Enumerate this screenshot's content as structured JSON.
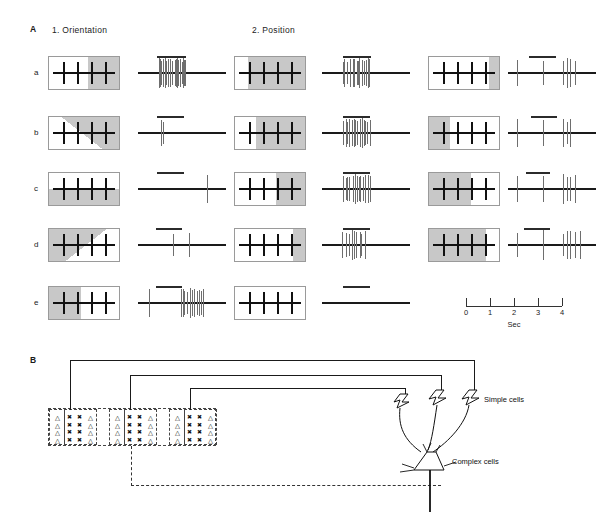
{
  "figure": {
    "panels": [
      {
        "letter": "A",
        "x": 30,
        "y": 24
      },
      {
        "letter": "B",
        "x": 30,
        "y": 355
      }
    ],
    "column_headers": [
      {
        "label": "1.   Orientation",
        "x": 52,
        "y": 26
      },
      {
        "label": "2.   Position",
        "x": 252,
        "y": 26
      }
    ],
    "row_letters": [
      "a",
      "b",
      "c",
      "d",
      "e"
    ]
  },
  "panel_a": {
    "rows": [
      {
        "letter": "a",
        "cells": [
          {
            "column": "orientation",
            "stimulus": {
              "shade_type": "vertical-right",
              "shade_fraction": 0.45,
              "bars": 4
            },
            "response": {
              "spike_count": 19,
              "pattern": "strong-burst",
              "stim_bar_start_pct": 22,
              "stim_bar_width_pct": 32
            }
          },
          {
            "column": "position",
            "stimulus": {
              "shade_type": "vertical-right",
              "shade_fraction": 0.82,
              "bars": 4
            },
            "response": {
              "spike_count": 15,
              "pattern": "strong-burst",
              "stim_bar_start_pct": 24,
              "stim_bar_width_pct": 32
            }
          },
          {
            "column": "position-2",
            "stimulus": {
              "shade_type": "vertical-right",
              "shade_fraction": 0.14,
              "bars": 4
            },
            "response": {
              "spike_count": 6,
              "pattern": "sparse",
              "stim_bar_start_pct": 24,
              "stim_bar_width_pct": 30
            }
          }
        ]
      },
      {
        "letter": "b",
        "cells": [
          {
            "column": "orientation",
            "stimulus": {
              "shade_type": "diagonal-ne",
              "shade_fraction": 0.5,
              "bars": 4
            },
            "response": {
              "spike_count": 2,
              "pattern": "single",
              "stim_bar_start_pct": 22,
              "stim_bar_width_pct": 30
            }
          },
          {
            "column": "position",
            "stimulus": {
              "shade_type": "vertical-right",
              "shade_fraction": 0.7,
              "bars": 4
            },
            "response": {
              "spike_count": 14,
              "pattern": "strong-burst",
              "stim_bar_start_pct": 24,
              "stim_bar_width_pct": 30
            }
          },
          {
            "column": "position-2",
            "stimulus": {
              "shade_type": "vertical-left",
              "shade_fraction": 0.3,
              "bars": 4
            },
            "response": {
              "spike_count": 5,
              "pattern": "sparse",
              "stim_bar_start_pct": 26,
              "stim_bar_width_pct": 30
            }
          }
        ]
      },
      {
        "letter": "c",
        "cells": [
          {
            "column": "orientation",
            "stimulus": {
              "shade_type": "horizontal-bottom",
              "shade_fraction": 0.5,
              "bars": 4
            },
            "response": {
              "spike_count": 1,
              "pattern": "single-late",
              "stim_bar_start_pct": 22,
              "stim_bar_width_pct": 30
            }
          },
          {
            "column": "position",
            "stimulus": {
              "shade_type": "vertical-right",
              "shade_fraction": 0.42,
              "bars": 4
            },
            "response": {
              "spike_count": 13,
              "pattern": "strong-burst",
              "stim_bar_start_pct": 24,
              "stim_bar_width_pct": 30
            }
          },
          {
            "column": "position-2",
            "stimulus": {
              "shade_type": "vertical-left",
              "shade_fraction": 0.6,
              "bars": 4
            },
            "response": {
              "spike_count": 6,
              "pattern": "sparse",
              "stim_bar_start_pct": 20,
              "stim_bar_width_pct": 28
            }
          }
        ]
      },
      {
        "letter": "d",
        "cells": [
          {
            "column": "orientation",
            "stimulus": {
              "shade_type": "diagonal-nw",
              "shade_fraction": 0.5,
              "bars": 4
            },
            "response": {
              "spike_count": 2,
              "pattern": "pair",
              "stim_bar_start_pct": 20,
              "stim_bar_width_pct": 30
            }
          },
          {
            "column": "position",
            "stimulus": {
              "shade_type": "vertical-right",
              "shade_fraction": 0.17,
              "bars": 4
            },
            "response": {
              "spike_count": 9,
              "pattern": "burst",
              "stim_bar_start_pct": 24,
              "stim_bar_width_pct": 30
            }
          },
          {
            "column": "position-2",
            "stimulus": {
              "shade_type": "vertical-left",
              "shade_fraction": 0.82,
              "bars": 4
            },
            "response": {
              "spike_count": 7,
              "pattern": "sparse",
              "stim_bar_start_pct": 18,
              "stim_bar_width_pct": 30
            }
          }
        ]
      },
      {
        "letter": "e",
        "cells": [
          {
            "column": "orientation",
            "stimulus": {
              "shade_type": "vertical-left",
              "shade_fraction": 0.45,
              "bars": 4
            },
            "response": {
              "spike_count": 12,
              "pattern": "late-burst",
              "stim_bar_start_pct": 20,
              "stim_bar_width_pct": 30
            }
          },
          {
            "column": "position",
            "stimulus": {
              "shade_type": "none",
              "shade_fraction": 0,
              "bars": 4
            },
            "response": {
              "spike_count": 0,
              "pattern": "silent",
              "stim_bar_start_pct": 24,
              "stim_bar_width_pct": 30
            }
          }
        ]
      }
    ],
    "time_axis": {
      "ticks": [
        "0",
        "1",
        "2",
        "3",
        "4"
      ],
      "unit_label": "Sec",
      "min": 0,
      "max": 4
    }
  },
  "panel_b": {
    "receptive_field": {
      "groups": 3,
      "rows_per_group": 4,
      "triangle_symbol": "△",
      "cross_symbol": "✖",
      "column_pattern": [
        "triangle",
        "cross",
        "cross",
        "triangle"
      ]
    },
    "labels": {
      "simple_cells": "Simple cells",
      "complex_cells": "Complex cells"
    }
  },
  "colors": {
    "shade_grey": "#c8c8c8",
    "line_black": "#111111",
    "spike_grey": "#6e6e6e",
    "box_border": "#9a9a9a",
    "dashed_border": "#444444"
  }
}
